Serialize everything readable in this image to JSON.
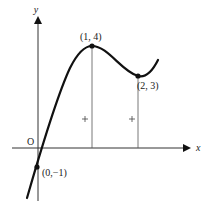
{
  "diagram": {
    "type": "function-graph",
    "axes": {
      "x_label": "x",
      "y_label": "y",
      "origin_label": "O"
    },
    "points": [
      {
        "label": "(1, 4)",
        "x": 1,
        "y": 4,
        "kind": "local-maximum"
      },
      {
        "label": "(2, 3)",
        "x": 2,
        "y": 3,
        "kind": "local-minimum"
      },
      {
        "label": "(0,−1)",
        "x": 0,
        "y": -1,
        "kind": "y-intercept"
      }
    ],
    "markers": [
      "+",
      "+"
    ],
    "colors": {
      "curve": "#111111",
      "axis": "#333333",
      "background": "#ffffff"
    }
  }
}
